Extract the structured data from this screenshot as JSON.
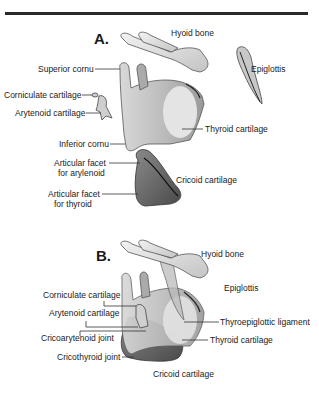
{
  "figure": {
    "panels": [
      {
        "id": "A",
        "label": "A.",
        "labels": {
          "hyoid_bone": "Hyoid bone",
          "epiglottis": "Epiglottis",
          "superior_cornu": "Superior cornu",
          "corniculate_cartilage": "Corniculate cartilage",
          "arytenoid_cartilage": "Arytenoid cartilage",
          "inferior_cornu": "Inferior cornu",
          "thyroid_cartilage": "Thyroid cartilage",
          "facet_arytenoid_1": "Articular facet",
          "facet_arytenoid_2": "for arylenoid",
          "facet_thyroid_1": "Articular facet",
          "facet_thyroid_2": "for thyroid",
          "cricoid_cartilage": "Cricoid cartilage"
        }
      },
      {
        "id": "B",
        "label": "B.",
        "labels": {
          "hyoid_bone": "Hyoid bone",
          "epiglottis": "Epiglottis",
          "corniculate_cartilage": "Corniculate cartilage",
          "arytenoid_cartilage": "Arytenoid cartilage",
          "cricoarytenoid_joint": "Cricoarytenoid joint",
          "cricothyroid_joint": "Cricothyroid joint",
          "thyroepiglottic_ligament": "Thyroepiglottic ligament",
          "thyroid_cartilage": "Thyroid cartilage",
          "cricoid_cartilage": "Cricoid cartilage"
        }
      }
    ],
    "colors": {
      "rule": "#2a2a2a",
      "cartilage_light": "#e6e6e6",
      "cartilage_mid": "#b8b8b8",
      "cartilage_dark": "#6e6e6e",
      "leader_line": "#333333"
    }
  }
}
